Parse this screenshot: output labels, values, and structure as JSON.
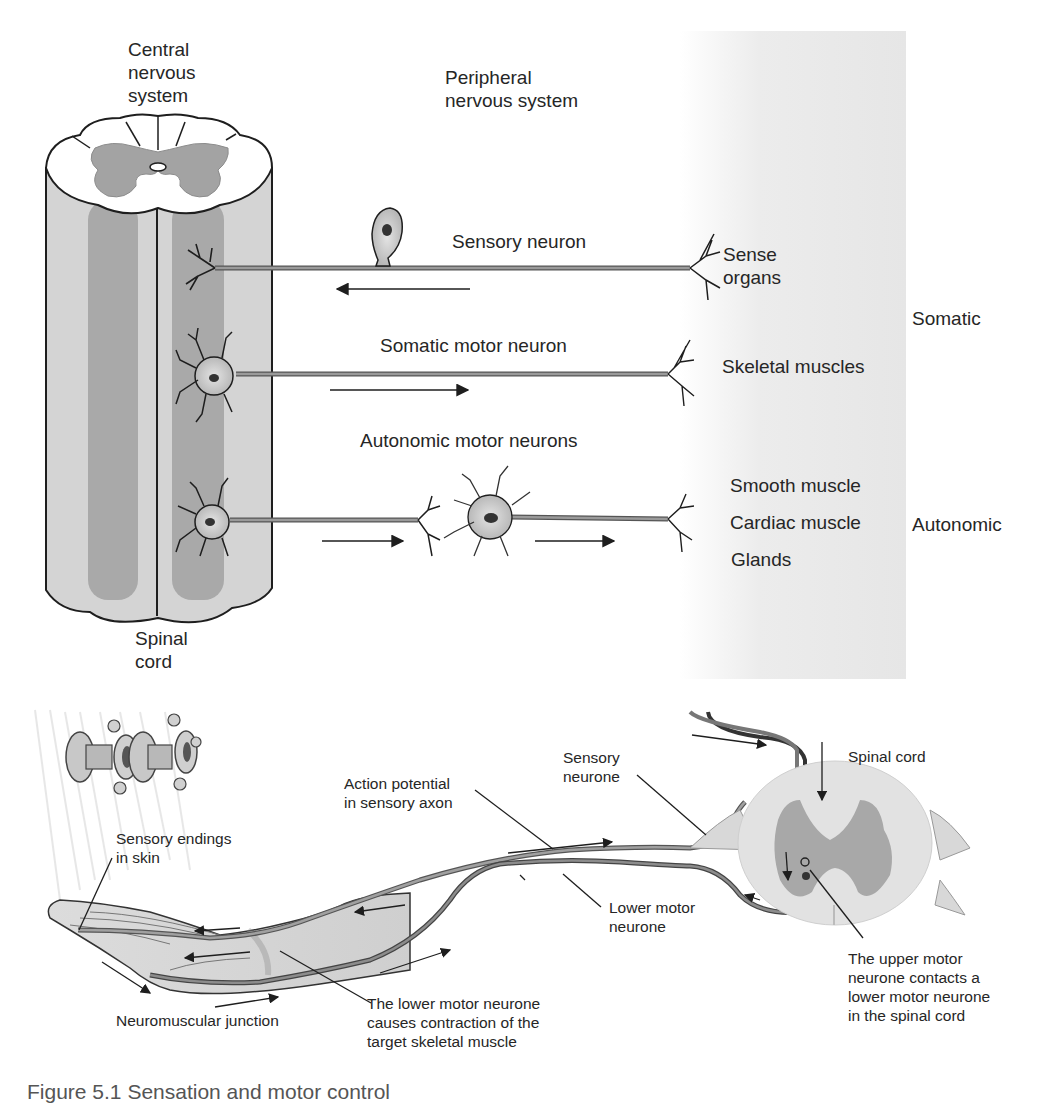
{
  "top_diagram": {
    "labels": {
      "cns": "Central\nnervous\nsystem",
      "pns": "Peripheral\nnervous system",
      "spinal_cord": "Spinal\ncord",
      "sensory_neuron": "Sensory neuron",
      "sense_organs": "Sense\norgans",
      "somatic": "Somatic",
      "somatic_motor_neuron": "Somatic motor neuron",
      "skeletal_muscles": "Skeletal muscles",
      "autonomic_motor_neurons": "Autonomic motor neurons",
      "smooth_muscle": "Smooth muscle",
      "cardiac_muscle": "Cardiac muscle",
      "glands": "Glands",
      "autonomic": "Autonomic"
    },
    "arrows": [
      {
        "pathway": "sensory",
        "direction": "left"
      },
      {
        "pathway": "somatic motor",
        "direction": "right"
      },
      {
        "pathway": "autonomic preganglionic",
        "direction": "right"
      },
      {
        "pathway": "autonomic postganglionic",
        "direction": "right"
      }
    ],
    "colors": {
      "cord_light": "#d4d4d4",
      "cord_dark": "#a9a9a9",
      "grey_matter": "#a3a3a3",
      "band": "#e8e8e8",
      "axon": "#8a8a8a",
      "outline": "#1e1e1e"
    }
  },
  "bottom_diagram": {
    "labels": {
      "sensory_endings": "Sensory endings\nin skin",
      "action_potential": "Action potential\nin sensory axon",
      "sensory_neurone": "Sensory\nneurone",
      "spinal_cord": "Spinal cord",
      "lower_motor_neurone": "Lower motor\nneurone",
      "neuromuscular_junction": "Neuromuscular junction",
      "lower_motor_contraction": "The lower motor neurone\ncauses contraction of the\ntarget skeletal muscle",
      "upper_motor_contact": "The upper motor\nneurone contacts a\nlower motor neurone\nin the spinal cord"
    },
    "stimulus_icon": "faucet-icon"
  },
  "caption": {
    "text": "Figure 5.1 Sensation and motor control"
  }
}
